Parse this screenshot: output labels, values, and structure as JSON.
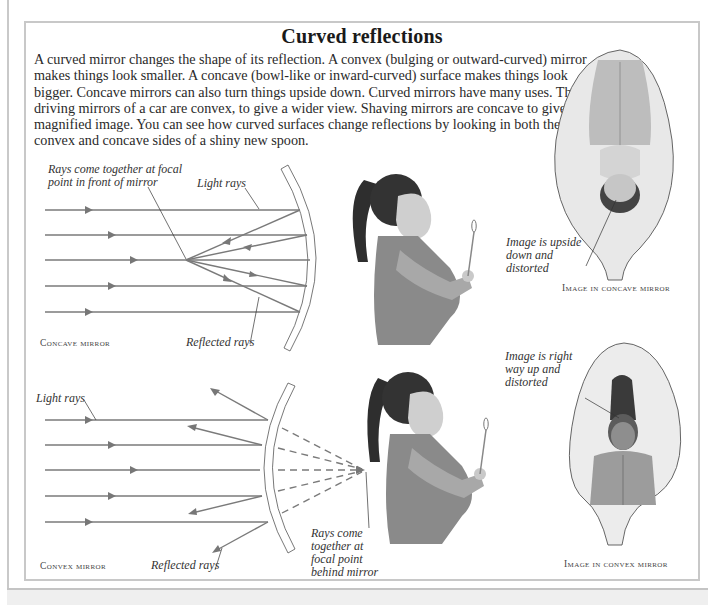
{
  "page": {
    "title": "Curved reflections",
    "intro": "A curved mirror changes the shape of its reflection. A convex (bulging or outward-curved) mirror makes things look smaller. A concave (bowl-like or inward-curved) surface makes things look bigger. Concave mirrors can also turn things upside down. Curved mirrors have many uses. The driving mirrors of a car are convex, to give a wider view. Shaving mirrors are concave to give a magnified image. You can see how curved surfaces change reflections by looking in both the convex and concave sides of a shiny new spoon."
  },
  "concave_diagram": {
    "caption": "Concave mirror",
    "label_focal": "Rays come together at focal point in front of mirror",
    "label_light_rays": "Light rays",
    "label_reflected_rays": "Reflected rays",
    "ray_count": 5
  },
  "convex_diagram": {
    "caption": "Convex mirror",
    "label_light_rays": "Light rays",
    "label_reflected_rays": "Reflected rays",
    "label_focal": "Rays come together at focal point behind mirror",
    "ray_count": 5
  },
  "concave_spoon": {
    "caption": "Image in concave mirror",
    "label": "Image is upside down and distorted"
  },
  "convex_spoon": {
    "caption": "Image in convex mirror",
    "label": "Image is right way up and distorted"
  },
  "colors": {
    "ray": "#7a7a7a",
    "mirror_outline": "#555555",
    "frame": "#c8c8c8",
    "text": "#222222"
  }
}
